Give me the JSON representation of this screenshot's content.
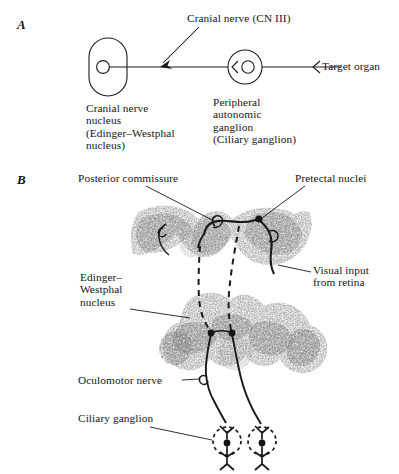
{
  "figure": {
    "background_color": "#ffffff",
    "ink_color": "#1a1a1a",
    "width": 399,
    "height": 474
  },
  "panel_a": {
    "letter": "A",
    "labels": {
      "cranial_nerve": "Cranial nerve (CN III)",
      "nucleus": "Cranial nerve\nnucleus\n(Edinger–Westphal\nnucleus)",
      "ganglion": "Peripheral\nautonomic\nganglion\n(Ciliary ganglion)",
      "target": "Target organ"
    },
    "elements": {
      "nucleus_shape": "rounded-rectangle",
      "nucleus_neuron": "circle",
      "ganglion_shape": "circle",
      "ganglion_neuron": "circle",
      "arrow_to_nerve": "diagonal-arrow",
      "target_marker": "chevron"
    }
  },
  "panel_b": {
    "letter": "B",
    "labels": {
      "posterior_commissure": "Posterior commissure",
      "pretectal_nuclei": "Pretectal nuclei",
      "edinger_westphal": "Edinger–\nWestphal\nnucleus",
      "visual_input": "Visual input\nfrom retina",
      "oculomotor_nerve": "Oculomotor nerve",
      "ciliary_ganglion": "Ciliary ganglion"
    },
    "elements": {
      "upper_section": "pretectal-brainstem-histology-section",
      "lower_section": "midbrain-oculomotor-histology-section",
      "preganglionic_tract": "dashed-line",
      "postganglionic_tract": "solid-line",
      "ganglion_marker": "dashed-circle",
      "neuron_marker": "filled-dot"
    }
  }
}
